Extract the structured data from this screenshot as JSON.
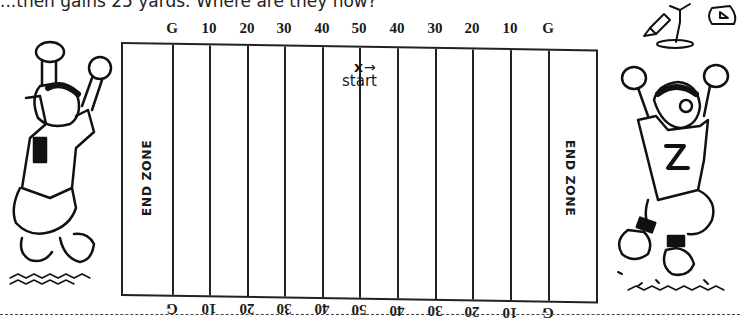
{
  "question": {
    "text": "...then gains 25 yards.  Where are they now?"
  },
  "field": {
    "top_labels": [
      "G",
      "10",
      "20",
      "30",
      "40",
      "50",
      "40",
      "30",
      "20",
      "10",
      "G"
    ],
    "bottom_labels": [
      "G",
      "10",
      "20",
      "30",
      "40",
      "50",
      "40",
      "30",
      "20",
      "10",
      "G"
    ],
    "left_endzone": "END ZONE",
    "right_endzone": "END ZONE",
    "line_color": "#222222"
  },
  "marker": {
    "symbol": "x",
    "arrow": "→",
    "label": "start",
    "yard_line": "50"
  },
  "illustrations": {
    "left": "cheering-football-player",
    "right": "cheering-football-player-number-2",
    "top_right": "pencil-and-compass"
  }
}
